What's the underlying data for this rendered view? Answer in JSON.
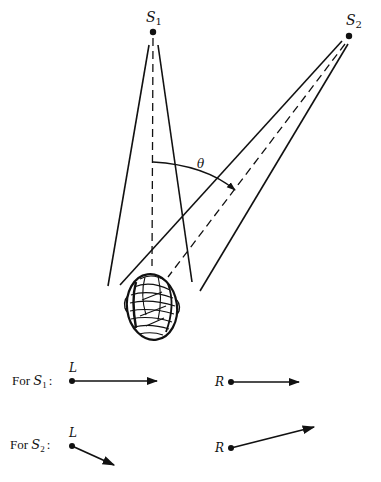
{
  "diagram": {
    "type": "sound-localization",
    "sources": [
      {
        "id": "S1",
        "label": "S",
        "subscript": "1",
        "x": 153,
        "y": 32
      },
      {
        "id": "S2",
        "label": "S",
        "subscript": "2",
        "x": 349,
        "y": 35
      }
    ],
    "angle_label": "θ",
    "head": {
      "cx": 152,
      "cy": 307
    },
    "rows": [
      {
        "label_prefix": "For ",
        "label_var": "S",
        "label_sub": "1",
        "label_suffix": ":",
        "left": {
          "label": "L",
          "x1": 72,
          "y1": 381,
          "x2": 157,
          "y2": 381
        },
        "right": {
          "label": "R",
          "x1": 231,
          "y1": 382,
          "x2": 299,
          "y2": 382
        }
      },
      {
        "label_prefix": "For ",
        "label_var": "S",
        "label_sub": "2",
        "label_suffix": ":",
        "left": {
          "label": "L",
          "x1": 72,
          "y1": 446,
          "x2": 114,
          "y2": 465
        },
        "right": {
          "label": "R",
          "x1": 231,
          "y1": 448,
          "x2": 314,
          "y2": 427
        }
      }
    ]
  }
}
